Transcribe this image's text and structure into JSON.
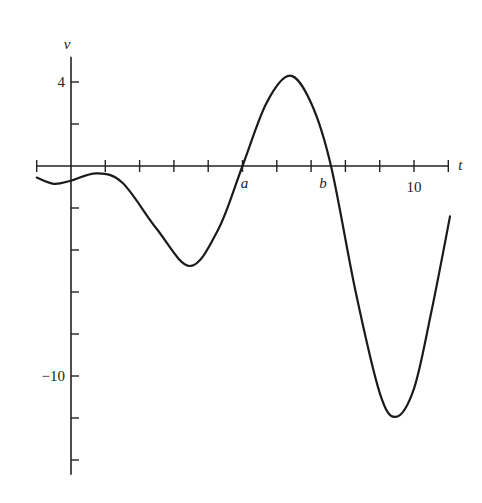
{
  "chart_data": {
    "type": "line",
    "title": "",
    "xlabel": "t",
    "ylabel": "v",
    "xlim": [
      -1,
      11
    ],
    "ylim": [
      -14.7,
      5.2
    ],
    "grid": false,
    "x_ticks": [
      -1,
      0,
      1,
      2,
      3,
      4,
      5,
      6,
      7,
      8,
      9,
      10,
      11
    ],
    "y_ticks": [
      4,
      2,
      0,
      -2,
      -4,
      -6,
      -8,
      -10,
      -12,
      -14
    ],
    "tick_labels": {
      "x": [
        {
          "value": 10,
          "label": "10"
        }
      ],
      "y": [
        {
          "value": 4,
          "label": "4"
        },
        {
          "value": -10,
          "label": "−10"
        }
      ]
    },
    "annotations": [
      {
        "text": "a",
        "t": 5.0,
        "v": 0,
        "note": "root"
      },
      {
        "text": "b",
        "t": 7.58,
        "v": 0,
        "note": "root"
      }
    ],
    "series": [
      {
        "name": "v(t)",
        "x": [
          -1.0,
          -0.5,
          0.0,
          0.75,
          1.5,
          2.5,
          3.47,
          4.3,
          5.0,
          5.7,
          6.38,
          7.0,
          7.58,
          8.3,
          9.0,
          9.47,
          10.0,
          10.5,
          11.05
        ],
        "y": [
          -0.55,
          -0.85,
          -0.7,
          -0.35,
          -0.8,
          -3.0,
          -4.76,
          -3.0,
          0.0,
          3.0,
          4.3,
          3.0,
          0.0,
          -6.0,
          -10.8,
          -11.95,
          -10.6,
          -7.0,
          -2.4
        ]
      }
    ]
  }
}
